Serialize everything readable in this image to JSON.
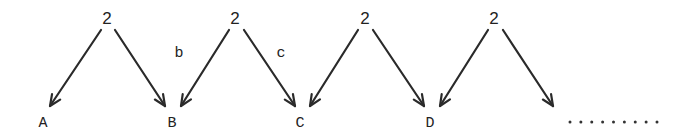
{
  "diagram": {
    "sources": [
      {
        "label": "2",
        "x": 107,
        "y": 24
      },
      {
        "label": "2",
        "x": 235,
        "y": 24
      },
      {
        "label": "2",
        "x": 365,
        "y": 24
      },
      {
        "label": "2",
        "x": 494,
        "y": 24
      }
    ],
    "targets": [
      {
        "label": "A",
        "x": 43,
        "y": 127
      },
      {
        "label": "B",
        "x": 172,
        "y": 127
      },
      {
        "label": "C",
        "x": 300,
        "y": 127
      },
      {
        "label": "D",
        "x": 430,
        "y": 127
      }
    ],
    "edge_labels": [
      {
        "label": "b",
        "x": 179,
        "y": 57
      },
      {
        "label": "c",
        "x": 281,
        "y": 57
      }
    ],
    "arrows": [
      {
        "x1": 101,
        "y1": 30,
        "x2": 50,
        "y2": 106
      },
      {
        "x1": 115,
        "y1": 30,
        "x2": 165,
        "y2": 106
      },
      {
        "x1": 229,
        "y1": 30,
        "x2": 181,
        "y2": 106
      },
      {
        "x1": 244,
        "y1": 30,
        "x2": 295,
        "y2": 106
      },
      {
        "x1": 358,
        "y1": 30,
        "x2": 310,
        "y2": 106
      },
      {
        "x1": 373,
        "y1": 30,
        "x2": 424,
        "y2": 106
      },
      {
        "x1": 488,
        "y1": 30,
        "x2": 440,
        "y2": 106
      },
      {
        "x1": 503,
        "y1": 30,
        "x2": 553,
        "y2": 106
      }
    ],
    "continuation": {
      "text": ".........",
      "dot_count": 9,
      "x_start": 570,
      "x_end": 657,
      "y": 122
    }
  }
}
